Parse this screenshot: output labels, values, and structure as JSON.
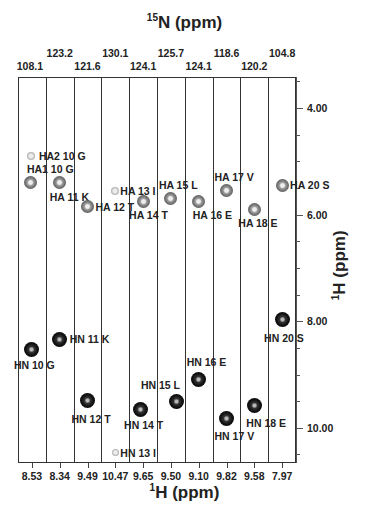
{
  "chart_data": {
    "type": "scatter",
    "subtype": "NMR 3D HNHA strip plot",
    "title_top": "15N (ppm)",
    "xlabel": "1H (ppm)",
    "ylabel": "1H (ppm)",
    "strips": [
      {
        "residue": "10 G",
        "n_ppm": "108.1",
        "h_ppm": "8.53"
      },
      {
        "residue": "11 K",
        "n_ppm": "123.2",
        "h_ppm": "8.34"
      },
      {
        "residue": "12 T",
        "n_ppm": "121.6",
        "h_ppm": "9.49"
      },
      {
        "residue": "13 I",
        "n_ppm": "130.1",
        "h_ppm": "10.47"
      },
      {
        "residue": "14 T",
        "n_ppm": "124.1",
        "h_ppm": "9.65"
      },
      {
        "residue": "15 L",
        "n_ppm": "125.7",
        "h_ppm": "9.50"
      },
      {
        "residue": "16 E",
        "n_ppm": "124.1",
        "h_ppm": "9.10"
      },
      {
        "residue": "17 V",
        "n_ppm": "118.6",
        "h_ppm": "9.82"
      },
      {
        "residue": "18 E",
        "n_ppm": "120.2",
        "h_ppm": "9.58"
      },
      {
        "residue": "20 S",
        "n_ppm": "104.8",
        "h_ppm": "7.97"
      }
    ],
    "y_ticks": [
      "4.00",
      "6.00",
      "8.00",
      "10.00"
    ],
    "ylim": [
      3.4,
      10.6
    ],
    "y_inverted": true,
    "grid": false,
    "peaks": [
      {
        "label": "HA2 10 G",
        "strip": 0,
        "y_ppm": 4.9,
        "type": "HA"
      },
      {
        "label": "HA1 10 G",
        "strip": 0,
        "y_ppm": 5.4,
        "type": "HA"
      },
      {
        "label": "HA 11 K",
        "strip": 1,
        "y_ppm": 5.4,
        "type": "HA"
      },
      {
        "label": "HA 12 T",
        "strip": 2,
        "y_ppm": 5.85,
        "type": "HA"
      },
      {
        "label": "HA 13 I",
        "strip": 3,
        "y_ppm": 5.55,
        "type": "HA"
      },
      {
        "label": "HA 14 T",
        "strip": 4,
        "y_ppm": 5.75,
        "type": "HA"
      },
      {
        "label": "HA 15 L",
        "strip": 5,
        "y_ppm": 5.7,
        "type": "HA"
      },
      {
        "label": "HA 16 E",
        "strip": 6,
        "y_ppm": 5.75,
        "type": "HA"
      },
      {
        "label": "HA 17 V",
        "strip": 7,
        "y_ppm": 5.55,
        "type": "HA"
      },
      {
        "label": "HA 18 E",
        "strip": 8,
        "y_ppm": 5.9,
        "type": "HA"
      },
      {
        "label": "HA 20 S",
        "strip": 9,
        "y_ppm": 5.45,
        "type": "HA"
      },
      {
        "label": "HN 10 G",
        "strip": 0,
        "y_ppm": 8.53,
        "type": "HN"
      },
      {
        "label": "HN 11 K",
        "strip": 1,
        "y_ppm": 8.34,
        "type": "HN"
      },
      {
        "label": "HN 12 T",
        "strip": 2,
        "y_ppm": 9.49,
        "type": "HN"
      },
      {
        "label": "HN 13 I",
        "strip": 3,
        "y_ppm": 10.47,
        "type": "HN"
      },
      {
        "label": "HN 14 T",
        "strip": 4,
        "y_ppm": 9.65,
        "type": "HN"
      },
      {
        "label": "HN 15 L",
        "strip": 5,
        "y_ppm": 9.5,
        "type": "HN"
      },
      {
        "label": "HN 16 E",
        "strip": 6,
        "y_ppm": 9.1,
        "type": "HN"
      },
      {
        "label": "HN 17 V",
        "strip": 7,
        "y_ppm": 9.82,
        "type": "HN"
      },
      {
        "label": "HN 18 E",
        "strip": 8,
        "y_ppm": 9.58,
        "type": "HN"
      },
      {
        "label": "HN 20 S",
        "strip": 9,
        "y_ppm": 7.97,
        "type": "HN"
      }
    ]
  },
  "labels": {
    "top_title": "N (ppm)",
    "top_title_sup": "15",
    "bottom_title": "H (ppm)",
    "bottom_title_sup": "1",
    "right_title": "H (ppm)",
    "right_title_sup": "1"
  }
}
